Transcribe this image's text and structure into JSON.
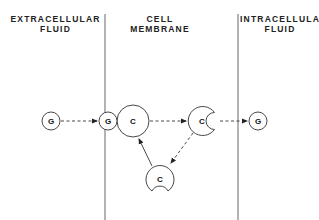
{
  "regions": [
    {
      "id": "extracellular",
      "line1": "EXTRACELLULAR",
      "line2": "FLUID"
    },
    {
      "id": "membrane",
      "line1": "CELL",
      "line2": "MEMBRANE"
    },
    {
      "id": "intracellular",
      "line1": "INTRACELLULAR",
      "line2": "FLUID"
    }
  ],
  "molecules": {
    "g_outside": "G",
    "g_bound": "G",
    "carrier_bound": "C",
    "carrier_open_inside": "C",
    "carrier_recycling": "C",
    "g_inside": "G"
  },
  "colors": {
    "ink": "#333333",
    "background": "#ffffff"
  }
}
